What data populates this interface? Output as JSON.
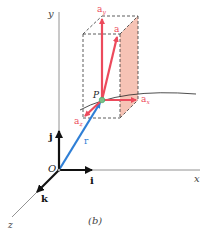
{
  "figure": {
    "caption": "(b)",
    "axes": {
      "x_label": "x",
      "y_label": "y",
      "z_label": "z",
      "origin_label": "O"
    },
    "unit_vectors": {
      "i": "i",
      "j": "j",
      "k": "k"
    },
    "position_vector": "r",
    "point_label": "P",
    "acceleration": {
      "a": "a",
      "ax": "a",
      "ax_sub": "x",
      "ay": "a",
      "ay_sub": "y",
      "az": "a",
      "az_sub": "z"
    },
    "colors": {
      "acceleration": "#ec4a5c",
      "position": "#2f7fd6",
      "axes": "#555555",
      "unit_vectors": "#111111",
      "shaded_face": "#f4b8a8",
      "point": "#7cc08a"
    }
  }
}
